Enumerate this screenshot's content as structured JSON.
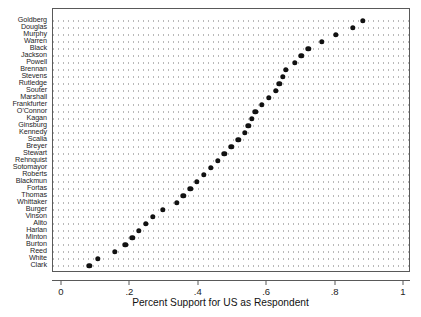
{
  "chart_data": {
    "type": "scatter",
    "title": "",
    "xlabel": "Percent Support for US as Respondent",
    "ylabel": "",
    "xlim": [
      0,
      1
    ],
    "xticks": [
      0,
      0.2,
      0.4,
      0.6,
      0.8,
      1
    ],
    "xticklabels": [
      "0",
      ".2",
      ".4",
      ".6",
      ".8",
      "1"
    ],
    "grid": "horizontal-dotted",
    "legend": "none",
    "orientation": "horizontal-dot-plot",
    "marker": "filled-circle",
    "marker_color": "#111111",
    "categories": [
      "Goldberg",
      "Douglas",
      "Murphy",
      "Warren",
      "Black",
      "Jackson",
      "Powell",
      "Brennan",
      "Stevens",
      "Rutledge",
      "Souter",
      "Marshall",
      "Frankfurter",
      "O'Connor",
      "Kagan",
      "Ginsburg",
      "Kennedy",
      "Scalia",
      "Breyer",
      "Stewart",
      "Rehnquist",
      "Sotomayor",
      "Roberts",
      "Blackmun",
      "Fortas",
      "Thomas",
      "Whittaker",
      "Burger",
      "Vinson",
      "Alito",
      "Harlan",
      "Minton",
      "Burton",
      "Reed",
      "White",
      "Clark"
    ],
    "values": [
      0.88,
      0.85,
      0.8,
      0.76,
      0.72,
      0.7,
      0.68,
      0.655,
      0.645,
      0.635,
      0.625,
      0.605,
      0.585,
      0.565,
      0.555,
      0.545,
      0.535,
      0.515,
      0.495,
      0.475,
      0.455,
      0.435,
      0.415,
      0.395,
      0.375,
      0.355,
      0.335,
      0.295,
      0.265,
      0.245,
      0.225,
      0.205,
      0.185,
      0.155,
      0.105,
      0.08
    ]
  }
}
